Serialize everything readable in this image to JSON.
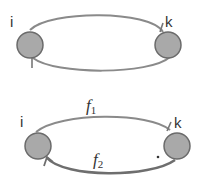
{
  "diagram": {
    "top": {
      "nodes": [
        {
          "id": "i",
          "label": "i"
        },
        {
          "id": "k",
          "label": "k"
        }
      ],
      "edges": [
        {
          "from": "i",
          "to": "k",
          "path": "upper"
        },
        {
          "from": "k",
          "to": "i",
          "path": "lower"
        }
      ]
    },
    "bottom": {
      "nodes": [
        {
          "id": "i",
          "label": "i"
        },
        {
          "id": "k",
          "label": "k"
        }
      ],
      "edges": [
        {
          "from": "i",
          "to": "k",
          "path": "upper",
          "label_base": "f",
          "label_sub": "1"
        },
        {
          "from": "k",
          "to": "i",
          "path": "lower",
          "label_base": "f",
          "label_sub": "2"
        }
      ],
      "annotation": "."
    },
    "colors": {
      "node_fill": "#a9a9a9",
      "node_stroke": "#6b6b6b",
      "edge": "#8a8a8a",
      "edge_dark": "#6e6e6e",
      "text": "#333333"
    }
  }
}
